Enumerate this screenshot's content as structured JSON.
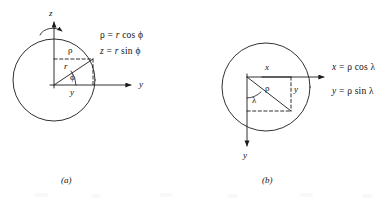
{
  "figure": {
    "stroke_color": "#1a1a1a",
    "background_color": "#ffffff"
  },
  "panel_a": {
    "caption": "(a)",
    "axis_z_label": "z",
    "axis_y_label": "y",
    "segment_rho_label": "ρ",
    "segment_r_label": "r",
    "angle_label": "ϕ",
    "base_label": "y",
    "equations": [
      {
        "lhs": "ρ",
        "rel": "=",
        "rhs_var": "r",
        "rhs_fn": "cos",
        "rhs_angle": "ϕ"
      },
      {
        "lhs": "z",
        "rel": "=",
        "rhs_var": "r",
        "rhs_fn": "sin",
        "rhs_angle": "ϕ"
      }
    ],
    "rotation_arrow": "curved-arrow-about-z"
  },
  "panel_b": {
    "caption": "(b)",
    "axis_x_label": "x",
    "axis_y_label": "y",
    "segment_x_label": "x",
    "segment_rho_label": "ρ",
    "segment_y_label": "y",
    "angle_label": "λ",
    "equations": [
      {
        "lhs": "x",
        "rel": "=",
        "rhs_var": "ρ",
        "rhs_fn": "cos",
        "rhs_angle": "λ"
      },
      {
        "lhs": "y",
        "rel": "=",
        "rhs_var": "ρ",
        "rhs_fn": "sin",
        "rhs_angle": "λ"
      }
    ]
  }
}
